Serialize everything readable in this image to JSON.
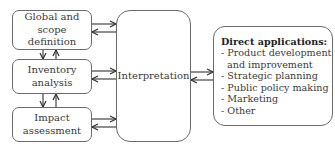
{
  "diagram": {
    "boxes": {
      "global": {
        "lines": [
          "Global and",
          "scope definition"
        ]
      },
      "inventory": {
        "lines": [
          "Inventory",
          "analysis"
        ]
      },
      "impact": {
        "lines": [
          "Impact",
          "assessment"
        ]
      },
      "interpretation": {
        "label": "Interpretation"
      },
      "applications": {
        "title": "Direct applications:",
        "items": [
          "- Product development",
          "  and improvement",
          "- Strategic planning",
          "- Public policy making",
          "- Marketing",
          "- Other"
        ]
      }
    },
    "colors": {
      "stroke": "#6a6a6a",
      "arrow": "#333333",
      "text": "#3a3a3a"
    },
    "arrows": [
      "global <-> interpretation",
      "inventory <-> interpretation",
      "impact <-> interpretation",
      "global <-> inventory",
      "inventory <-> impact",
      "interpretation <-> direct applications"
    ]
  }
}
